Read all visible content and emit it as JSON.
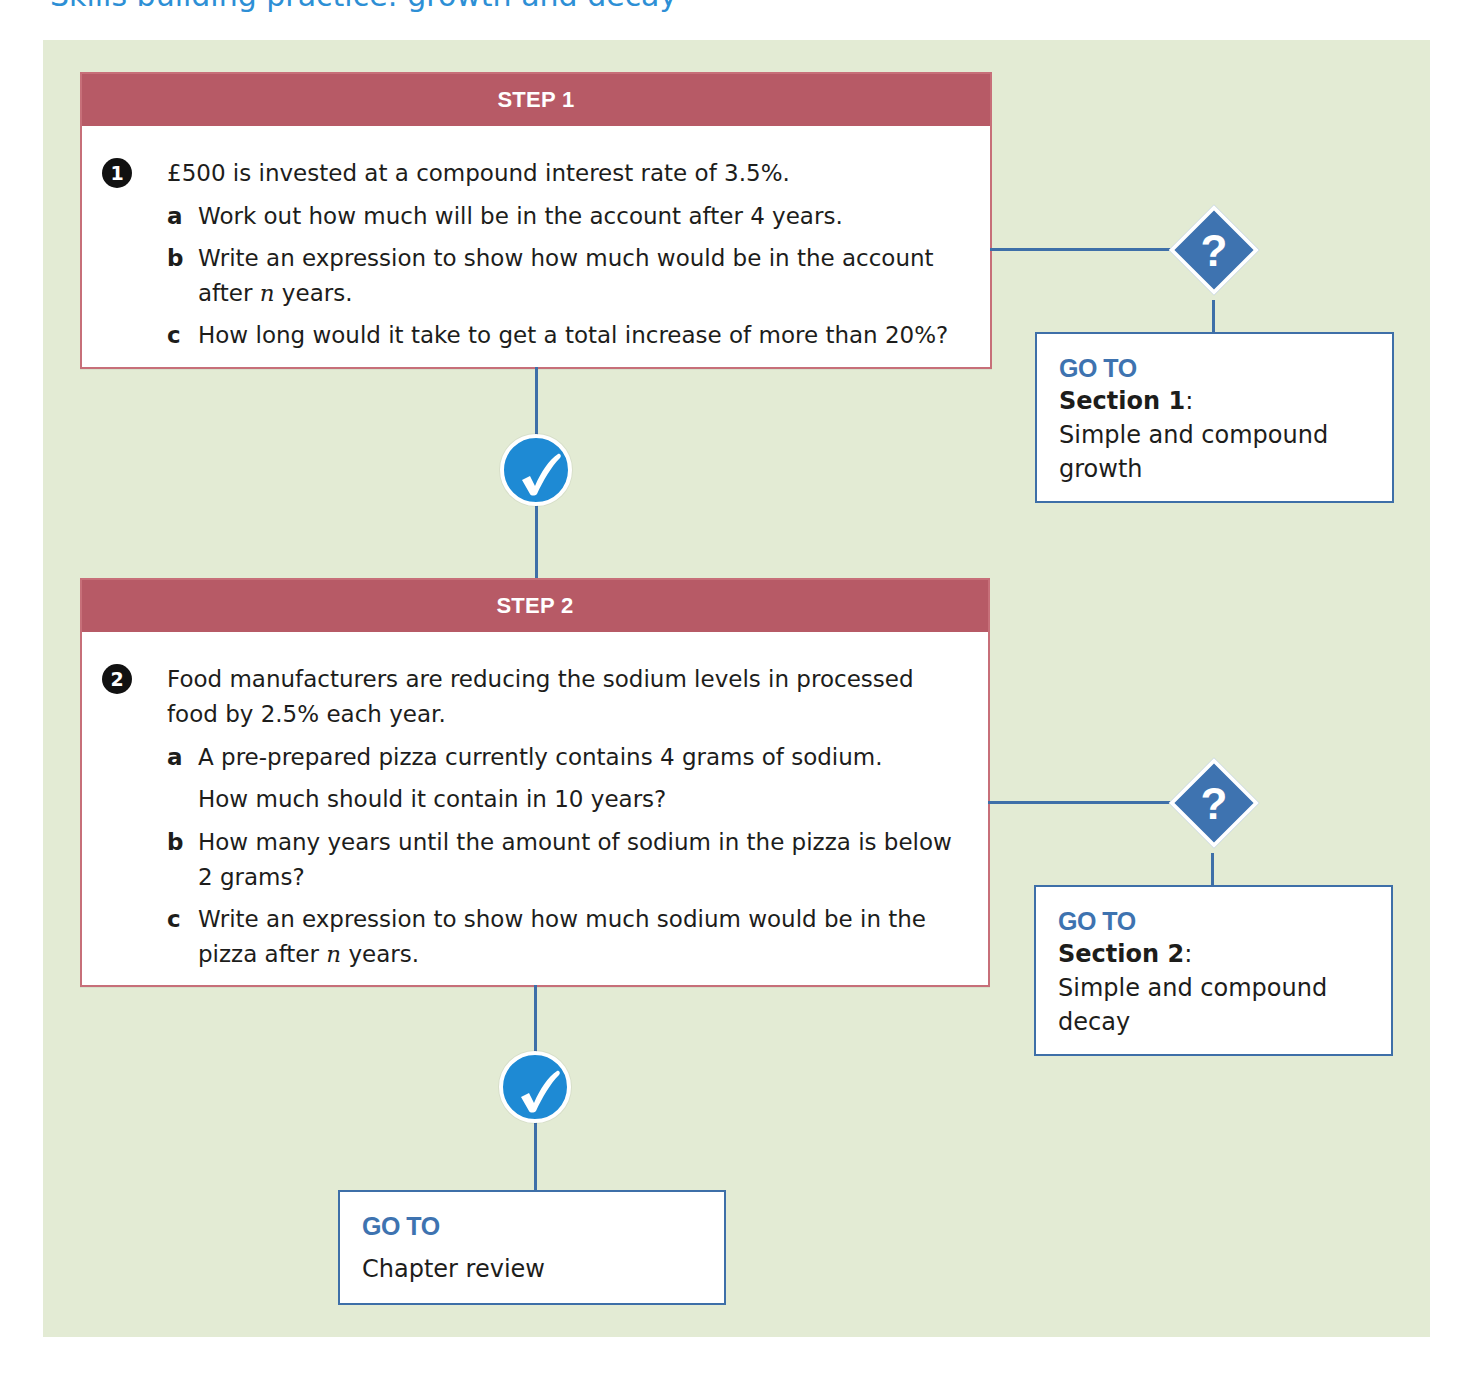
{
  "page": {
    "top_heading_clipped": "Skills building practice: growth and decay"
  },
  "colors": {
    "panel_bg": "#e3ebd4",
    "step_header": "#b75a66",
    "step_border": "#c76f79",
    "accent_blue": "#3e73b0",
    "check_blue": "#1e8ad4",
    "heading_blue": "#2d8fd5"
  },
  "steps": [
    {
      "header": "STEP 1",
      "question_number": "1",
      "stem": "£500 is invested at a compound interest rate of 3.5%.",
      "parts": [
        {
          "letter": "a",
          "text": "Work out how much will be in the account after 4 years."
        },
        {
          "letter": "b",
          "text_before": "Write an expression to show how much would be in the account",
          "text_line2_before": "after ",
          "variable": "n",
          "text_after": " years."
        },
        {
          "letter": "c",
          "text": "How long would it take to get a total increase of more than 20%?"
        }
      ],
      "help": {
        "icon": "question-mark-icon",
        "icon_glyph": "?",
        "goto_label": "GO TO",
        "section_label": "Section 1",
        "section_colon": ":",
        "section_desc": "Simple and compound growth"
      },
      "success_icon": "checkmark-icon"
    },
    {
      "header": "STEP 2",
      "question_number": "2",
      "stem": "Food manufacturers are reducing the sodium levels in processed food by 2.5% each year.",
      "parts": [
        {
          "letter": "a",
          "text": "A pre-prepared pizza currently contains 4 grams of sodium.",
          "text_line2": "How much should it contain in 10 years?"
        },
        {
          "letter": "b",
          "text": "How many years until the amount of sodium in the pizza is below 2 grams?"
        },
        {
          "letter": "c",
          "text_before": "Write an expression to show how much sodium would be in the",
          "text_line2_before": "pizza after ",
          "variable": "n",
          "text_after": " years."
        }
      ],
      "help": {
        "icon": "question-mark-icon",
        "icon_glyph": "?",
        "goto_label": "GO TO",
        "section_label": "Section 2",
        "section_colon": ":",
        "section_desc": "Simple and compound decay"
      },
      "success_icon": "checkmark-icon"
    }
  ],
  "final": {
    "goto_label": "GO TO",
    "desc": "Chapter review"
  }
}
